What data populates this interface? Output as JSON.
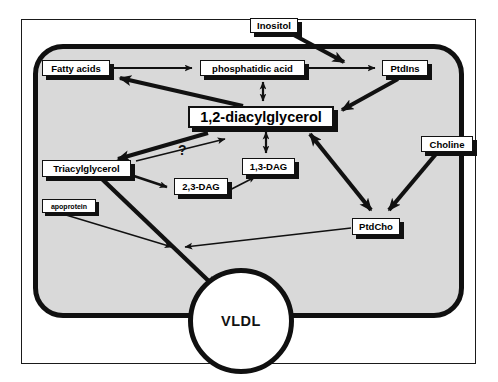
{
  "diagram": {
    "compartment_label": "cell",
    "question_marker": "?",
    "colors": {
      "cytosol": "#d9d9d9",
      "membrane": "#101010",
      "node_fill": "#ffffff",
      "node_border": "#111111",
      "shadow": "#101010",
      "frame": "#1a1a1a",
      "arrow": "#111111"
    },
    "nodes": [
      {
        "id": "inositol",
        "label": "Inositol",
        "style": "small-bold"
      },
      {
        "id": "fatty_acids",
        "label": "Fatty acids",
        "style": "small-bold"
      },
      {
        "id": "pa",
        "label": "phosphatidic acid",
        "style": "small-bold"
      },
      {
        "id": "ptdins",
        "label": "PtdIns",
        "style": "small-bold"
      },
      {
        "id": "dag12",
        "label": "1,2-diacylglycerol",
        "style": "large-bold"
      },
      {
        "id": "choline",
        "label": "Choline",
        "style": "small-bold"
      },
      {
        "id": "tag",
        "label": "Triacylglycerol",
        "style": "small-bold"
      },
      {
        "id": "dag13",
        "label": "1,3-DAG",
        "style": "small-bold"
      },
      {
        "id": "dag23",
        "label": "2,3-DAG",
        "style": "small-bold"
      },
      {
        "id": "apoprotein",
        "label": "apoprotein",
        "style": "tiny-bold"
      },
      {
        "id": "ptdcho",
        "label": "PtdCho",
        "style": "small-bold"
      },
      {
        "id": "vldl",
        "label": "VLDL",
        "style": "circle-bold"
      }
    ],
    "edges": [
      {
        "from": "fatty_acids",
        "to": "pa",
        "weight": "thin",
        "heads": "single"
      },
      {
        "from": "inositol",
        "to": "ptdins",
        "weight": "thick",
        "heads": "single"
      },
      {
        "from": "pa",
        "to": "ptdins",
        "weight": "thin",
        "heads": "single"
      },
      {
        "from": "pa",
        "to": "dag12",
        "weight": "thin",
        "heads": "double"
      },
      {
        "from": "dag12",
        "to": "fatty_acids",
        "weight": "thick",
        "heads": "single"
      },
      {
        "from": "ptdins",
        "to": "dag12",
        "weight": "thick",
        "heads": "single"
      },
      {
        "from": "dag12",
        "to": "tag",
        "weight": "thick",
        "heads": "single"
      },
      {
        "from": "tag",
        "to": "dag12",
        "weight": "thin",
        "heads": "single",
        "label": "?"
      },
      {
        "from": "dag12",
        "to": "dag13",
        "weight": "thin",
        "heads": "double"
      },
      {
        "from": "dag12",
        "to": "ptdcho",
        "weight": "thick",
        "heads": "double"
      },
      {
        "from": "choline",
        "to": "ptdcho",
        "weight": "thick",
        "heads": "single"
      },
      {
        "from": "tag",
        "to": "dag23",
        "weight": "thin",
        "heads": "single"
      },
      {
        "from": "dag13",
        "to": "dag23",
        "weight": "thin",
        "heads": "double"
      },
      {
        "from": "tag",
        "to": "vldl",
        "weight": "thick",
        "heads": "single"
      },
      {
        "from": "apoprotein",
        "to": "vldl",
        "weight": "thin",
        "heads": "single"
      },
      {
        "from": "ptdcho",
        "to": "vldl",
        "weight": "thin",
        "heads": "single"
      }
    ]
  }
}
